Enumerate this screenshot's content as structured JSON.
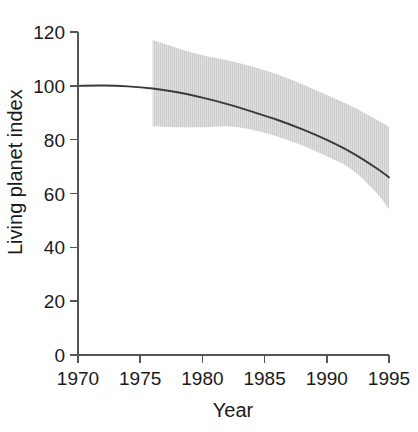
{
  "chart_data": {
    "type": "line",
    "title": "",
    "subtitle": "",
    "xlabel": "Year",
    "ylabel": "Living planet index",
    "xlim": [
      1970,
      1995
    ],
    "ylim": [
      0,
      120
    ],
    "grid": false,
    "legend": null,
    "x_ticks": [
      1970,
      1975,
      1980,
      1985,
      1990,
      1995
    ],
    "x_tick_labels": [
      "1970",
      "1975",
      "1980",
      "1985",
      "1990",
      "1995"
    ],
    "y_ticks": [
      0,
      20,
      40,
      60,
      80,
      100,
      120
    ],
    "y_tick_labels": [
      "0",
      "20",
      "40",
      "60",
      "80",
      "100",
      "120"
    ],
    "series": [
      {
        "name": "Living planet index",
        "kind": "line",
        "color": "#3a3a3a",
        "x": [
          1970,
          1972,
          1974,
          1976,
          1978,
          1980,
          1982,
          1984,
          1986,
          1988,
          1990,
          1992,
          1994,
          1995
        ],
        "values": [
          100.0,
          100.1,
          99.8,
          99.0,
          97.6,
          95.6,
          93.2,
          90.4,
          87.4,
          83.9,
          79.9,
          75.2,
          69.4,
          66.0
        ]
      },
      {
        "name": "Confidence band",
        "kind": "band",
        "color": "#d9d9d9",
        "x": [
          1976,
          1978,
          1980,
          1982,
          1984,
          1986,
          1988,
          1990,
          1992,
          1994,
          1995
        ],
        "upper": [
          117.0,
          114.0,
          111.4,
          109.5,
          107.2,
          104.3,
          100.7,
          96.6,
          92.4,
          87.4,
          84.8
        ],
        "lower": [
          85.0,
          84.6,
          84.6,
          85.0,
          83.7,
          81.2,
          77.9,
          73.8,
          68.9,
          60.2,
          54.2
        ]
      }
    ],
    "annotations": []
  },
  "axes": {
    "y_axis_title": "Living planet index",
    "x_axis_title": "Year"
  },
  "colors": {
    "band": "#d9d9d9",
    "band_hatch": "#cfcfcf",
    "curve": "#3a3a3a",
    "axis": "#555555",
    "text": "#1a1a1a",
    "background": "#ffffff"
  }
}
